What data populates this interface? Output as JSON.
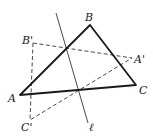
{
  "figure": {
    "labels": {
      "A": "A",
      "B": "B",
      "C": "C",
      "A_prime": "A'",
      "B_prime": "B'",
      "C_prime": "C'",
      "line": "ℓ"
    },
    "points": {
      "A": [
        20,
        95
      ],
      "B": [
        90,
        25
      ],
      "C": [
        136,
        85
      ],
      "A_prime": [
        132,
        58
      ],
      "B_prime": [
        33,
        43
      ],
      "C_prime": [
        30,
        120
      ]
    },
    "line_l": {
      "from": [
        56,
        13
      ],
      "to": [
        88,
        123
      ]
    },
    "styles": {
      "original_triangle": "solid",
      "image_triangle": "dashed",
      "stroke_color": "#1a1a1a"
    }
  }
}
